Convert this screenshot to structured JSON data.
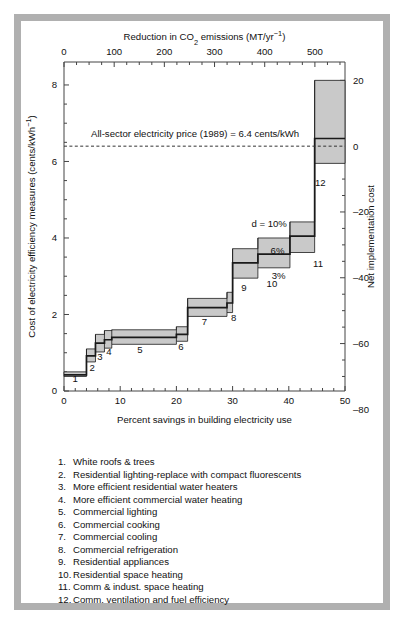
{
  "chart_data": {
    "type": "area",
    "title": "",
    "xlabel": "Percent savings in building electricity use",
    "ylabel": "Cost of electricity efficiency measures (cents/kWh⁻¹)",
    "top_axis_label": "Reduction in CO₂ emissions (MT/yr⁻¹)",
    "right_axis_label": "Net implementation cost",
    "xlim": [
      0,
      50
    ],
    "ylim": [
      0,
      8.6
    ],
    "xticks": [
      0,
      10,
      20,
      30,
      40,
      50
    ],
    "yticks": [
      0,
      2,
      4,
      6,
      8
    ],
    "x_minor_step": 2,
    "y_minor_step": 0.5,
    "top_xlim": [
      0,
      560
    ],
    "top_xticks": [
      0,
      100,
      200,
      300,
      400,
      500
    ],
    "top_minor_step": 25,
    "right_ticks": [
      20,
      0,
      -20,
      -40,
      -60,
      -80
    ],
    "right_minor_step": 5,
    "grid": false,
    "legend_position": "below-plot",
    "reference_line": {
      "value": 6.4,
      "style": "dashed",
      "label": "All-sector electricity price (1989) = 6.4 cents/kWh"
    },
    "discount_rate_labels": [
      {
        "text": "d = 10%",
        "band": "upper"
      },
      {
        "text": "6%",
        "band": "middle"
      },
      {
        "text": "3%",
        "band": "lower"
      }
    ],
    "series": [
      {
        "name": "d = 10%",
        "description": "upper band edge of step curve"
      },
      {
        "name": "6%",
        "description": "central black step curve"
      },
      {
        "name": "3%",
        "description": "lower band edge of step curve"
      }
    ],
    "steps": [
      {
        "id": 1,
        "label": "1",
        "x_start": 0.0,
        "x_end": 4.0,
        "cost_3": 0.38,
        "cost_6": 0.42,
        "cost_10": 0.5
      },
      {
        "id": 2,
        "label": "2",
        "x_start": 4.0,
        "x_end": 5.6,
        "cost_3": 0.76,
        "cost_6": 0.92,
        "cost_10": 1.1
      },
      {
        "id": 3,
        "label": "3",
        "x_start": 5.6,
        "x_end": 7.2,
        "cost_3": 1.02,
        "cost_6": 1.25,
        "cost_10": 1.48
      },
      {
        "id": 4,
        "label": "4",
        "x_start": 7.2,
        "x_end": 8.5,
        "cost_3": 1.12,
        "cost_6": 1.34,
        "cost_10": 1.58
      },
      {
        "id": 5,
        "label": "5",
        "x_start": 8.5,
        "x_end": 20.0,
        "cost_3": 1.22,
        "cost_6": 1.4,
        "cost_10": 1.6
      },
      {
        "id": 6,
        "label": "6",
        "x_start": 20.0,
        "x_end": 22.0,
        "cost_3": 1.3,
        "cost_6": 1.48,
        "cost_10": 1.68
      },
      {
        "id": 7,
        "label": "7",
        "x_start": 22.0,
        "x_end": 29.0,
        "cost_3": 1.95,
        "cost_6": 2.18,
        "cost_10": 2.42
      },
      {
        "id": 8,
        "label": "8",
        "x_start": 29.0,
        "x_end": 30.0,
        "cost_3": 2.05,
        "cost_6": 2.3,
        "cost_10": 2.58
      },
      {
        "id": 9,
        "label": "9",
        "x_start": 30.0,
        "x_end": 34.5,
        "cost_3": 2.95,
        "cost_6": 3.35,
        "cost_10": 3.72
      },
      {
        "id": 10,
        "label": "10",
        "x_start": 34.5,
        "x_end": 40.2,
        "cost_3": 3.22,
        "cost_6": 3.58,
        "cost_10": 4.0
      },
      {
        "id": 11,
        "label": "11",
        "x_start": 40.2,
        "x_end": 44.6,
        "cost_3": 3.62,
        "cost_6": 4.05,
        "cost_10": 4.42
      },
      {
        "id": 12,
        "label": "12",
        "x_start": 44.6,
        "x_end": 50.0,
        "cost_3": 5.95,
        "cost_6": 6.6,
        "cost_10": 8.12
      }
    ],
    "step_number_labels": [
      "1",
      "2",
      "3",
      "4",
      "5",
      "6",
      "7",
      "8",
      "9",
      "10",
      "11",
      "12"
    ]
  },
  "axes": {
    "top_label": "Reduction in CO₂ emissions (MT/yr⁻¹)",
    "top_ticks": [
      "0",
      "100",
      "200",
      "300",
      "400",
      "500"
    ],
    "left_label": "Cost of electricity efficiency measures (cents/kWh⁻¹)",
    "left_ticks": [
      "8",
      "6",
      "4",
      "2",
      "0"
    ],
    "bottom_label": "Percent savings in building electricity use",
    "bottom_ticks": [
      "0",
      "10",
      "20",
      "30",
      "40",
      "50"
    ],
    "right_label": "Net implementation cost",
    "right_ticks": [
      "20",
      "0",
      "–20",
      "–40",
      "–60",
      "–80"
    ]
  },
  "annotations": {
    "reference_line_text": "All-sector electricity price (1989) = 6.4 cents/kWh",
    "d10": "d = 10%",
    "d6": "6%",
    "d3": "3%"
  },
  "legend": {
    "items": [
      {
        "num": "1.",
        "text": "White roofs & trees"
      },
      {
        "num": "2.",
        "text": "Residential lighting-replace with compact fluorescents"
      },
      {
        "num": "3.",
        "text": "More efficient residential water heaters"
      },
      {
        "num": "4.",
        "text": "More efficient commercial water heating"
      },
      {
        "num": "5.",
        "text": "Commercial lighting"
      },
      {
        "num": "6.",
        "text": "Commercial cooking"
      },
      {
        "num": "7.",
        "text": "Commercial cooling"
      },
      {
        "num": "8.",
        "text": "Commercial refrigeration"
      },
      {
        "num": "9.",
        "text": "Residential appliances"
      },
      {
        "num": "10.",
        "text": "Residential space heating"
      },
      {
        "num": "11.",
        "text": "Comm & indust. space heating"
      },
      {
        "num": "12.",
        "text": "Comm. ventilation and fuel efficiency"
      }
    ]
  },
  "colors": {
    "band_fill": "#c9c9c9",
    "line": "#1a1a1a",
    "axis": "#444444",
    "frame": "#b0b0b0",
    "background": "#ffffff"
  }
}
